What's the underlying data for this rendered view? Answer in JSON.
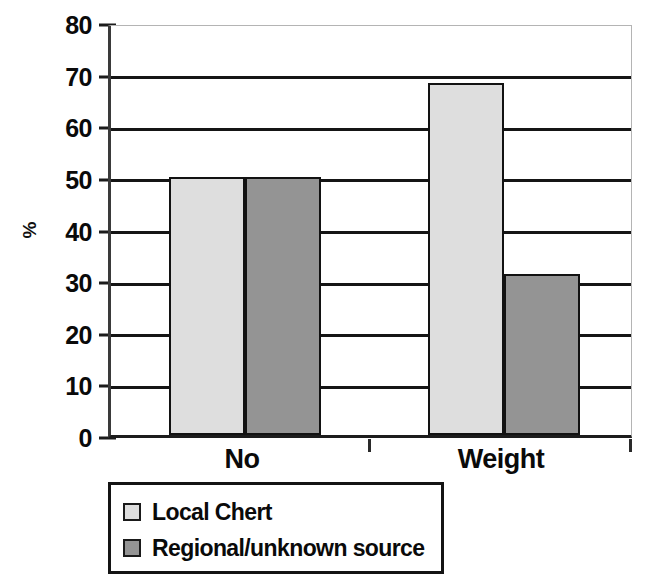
{
  "chart_data": {
    "type": "bar",
    "title": "",
    "xlabel": "",
    "ylabel": "%",
    "categories": [
      "No",
      "Weight"
    ],
    "series": [
      {
        "name": "Local Chert",
        "values": [
          50.0,
          68.2
        ],
        "color": "#dedede"
      },
      {
        "name": "Regional/unknown source",
        "values": [
          50.0,
          31.2
        ],
        "color": "#949494"
      }
    ],
    "ylim": [
      0,
      80
    ],
    "ytick_labels": [
      "0",
      "10",
      "20",
      "30",
      "40",
      "50",
      "60",
      "70",
      "80"
    ],
    "ytick_values": [
      0,
      10,
      20,
      30,
      40,
      50,
      60,
      70,
      80
    ],
    "grid": true,
    "legend_position": "below-axes"
  },
  "axis": {
    "y_title": "%",
    "ticks": [
      {
        "label": "80",
        "value": 80
      },
      {
        "label": "70",
        "value": 70
      },
      {
        "label": "60",
        "value": 60
      },
      {
        "label": "50",
        "value": 50
      },
      {
        "label": "40",
        "value": 40
      },
      {
        "label": "30",
        "value": 30
      },
      {
        "label": "20",
        "value": 20
      },
      {
        "label": "10",
        "value": 10
      },
      {
        "label": "0",
        "value": 0
      }
    ],
    "categories": [
      {
        "label": "No"
      },
      {
        "label": "Weight"
      }
    ]
  },
  "legend": {
    "entries": [
      {
        "label": "Local Chert",
        "color": "#dedede"
      },
      {
        "label": "Regional/unknown source",
        "color": "#949494"
      }
    ]
  }
}
